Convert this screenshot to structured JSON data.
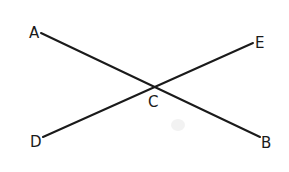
{
  "diagram": {
    "type": "intersecting-lines",
    "line_color": "#1a1a1a",
    "background": "#ffffff",
    "points": {
      "A": {
        "label": "A",
        "x": 41,
        "y": 33,
        "label_x": 29,
        "label_y": 38
      },
      "B": {
        "label": "B",
        "x": 260,
        "y": 137,
        "label_x": 261,
        "label_y": 148
      },
      "C": {
        "label": "C",
        "x": 152,
        "y": 87,
        "label_x": 148,
        "label_y": 107
      },
      "D": {
        "label": "D",
        "x": 43,
        "y": 137,
        "label_x": 30,
        "label_y": 147
      },
      "E": {
        "label": "E",
        "x": 253,
        "y": 43,
        "label_x": 255,
        "label_y": 48
      }
    },
    "lines": [
      {
        "name": "AB",
        "from": "A",
        "to": "B"
      },
      {
        "name": "DE",
        "from": "D",
        "to": "E"
      }
    ]
  }
}
